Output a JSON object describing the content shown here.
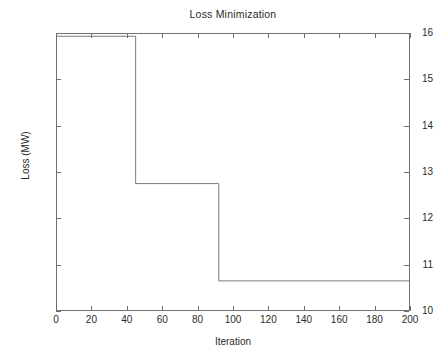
{
  "chart_data": {
    "type": "line",
    "title": "Loss Minimization",
    "xlabel": "Iteration",
    "ylabel": "Loss (MW)",
    "xlim": [
      0,
      200
    ],
    "ylim": [
      10,
      16
    ],
    "grid": false,
    "legend": false,
    "drawstyle": "steps-post",
    "line_color": "#7a7a7a",
    "xticks": [
      0,
      20,
      40,
      60,
      80,
      100,
      120,
      140,
      160,
      180,
      200
    ],
    "xticklabels": [
      "0",
      "20",
      "40",
      "60",
      "80",
      "100",
      "120",
      "140",
      "160",
      "180",
      "200"
    ],
    "yticks": [
      10,
      11,
      12,
      13,
      14,
      15,
      16
    ],
    "yticklabels": [
      "10",
      "11",
      "12",
      "13",
      "14",
      "15",
      "16"
    ],
    "series": [
      {
        "name": "Loss",
        "x": [
          0,
          45,
          45,
          92,
          92,
          200
        ],
        "values": [
          15.93,
          15.93,
          12.75,
          12.75,
          10.65,
          10.65
        ]
      }
    ],
    "steps": [
      {
        "start_iteration": 0,
        "end_iteration": 45,
        "loss": 15.93
      },
      {
        "start_iteration": 45,
        "end_iteration": 92,
        "loss": 12.75
      },
      {
        "start_iteration": 92,
        "end_iteration": 200,
        "loss": 10.65
      }
    ]
  }
}
